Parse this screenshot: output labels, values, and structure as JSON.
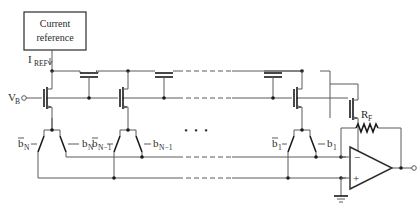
{
  "diagram": {
    "type": "circuit-schematic",
    "current_reference": {
      "line1": "Current",
      "line2": "reference"
    },
    "iref_label": {
      "main": "I",
      "sub": "REF"
    },
    "vb_label": {
      "main": "V",
      "sub": "B"
    },
    "switch_labels": [
      {
        "bar": true,
        "main": "b",
        "sub": "N"
      },
      {
        "bar": false,
        "main": "b",
        "sub": "N"
      },
      {
        "bar": true,
        "main": "b",
        "sub": "N−1"
      },
      {
        "bar": false,
        "main": "b",
        "sub": "N−1"
      },
      {
        "bar": true,
        "main": "b",
        "sub": "1"
      },
      {
        "bar": false,
        "main": "b",
        "sub": "1"
      }
    ],
    "ellipsis": "• • •",
    "rf_label": {
      "main": "R",
      "sub": "F"
    },
    "opamp": {
      "minus": "−",
      "plus": "+"
    },
    "vo_label": {
      "main": "V",
      "sub": "O"
    }
  }
}
